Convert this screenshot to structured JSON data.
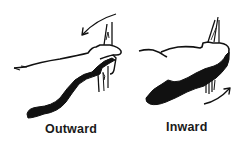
{
  "figure": {
    "type": "illustration",
    "panels": [
      {
        "id": "outward",
        "label": "Outward",
        "arrow_direction": "counter-clockwise, pointing down-left above the hand",
        "icon": "curved-arrow-left-icon"
      },
      {
        "id": "inward",
        "label": "Inward",
        "arrow_direction": "clockwise, pointing up-right below the hand",
        "icon": "curved-arrow-right-icon"
      }
    ]
  },
  "colors": {
    "ink": "#111111",
    "background": "#ffffff",
    "label": "#1a1a1a"
  }
}
